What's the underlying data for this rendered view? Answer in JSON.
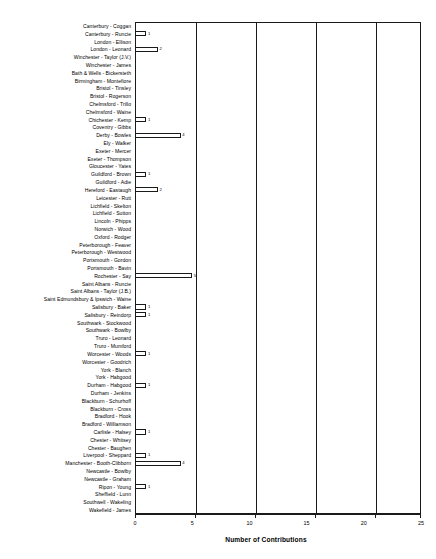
{
  "chart_data": {
    "type": "bar",
    "orientation": "horizontal",
    "title": "",
    "xlabel": "Number of Contributions",
    "ylabel": "",
    "xlim": [
      0,
      25
    ],
    "xticks": [
      0,
      5,
      10,
      15,
      20,
      25
    ],
    "gridlines": [
      5,
      10,
      15,
      20
    ],
    "grid": true,
    "legend": "none",
    "categories": [
      "Canterbury - Coggan",
      "Canterbury - Runcie",
      "London - Ellison",
      "London - Leonard",
      "Winchester - Taylor (J.V.)",
      "Winchester - James",
      "Bath & Wells - Bickersteth",
      "Birmingham - Montefiore",
      "Bristol - Tinsley",
      "Bristol - Rogerson",
      "Chelmsford - Trillo",
      "Chelmsford - Waine",
      "Chichester - Kemp",
      "Coventry - Gibbs",
      "Derby - Bowles",
      "Ely - Walker",
      "Exeter - Mercer",
      "Exeter - Thompson",
      "Gloucester - Yates",
      "Guildford - Brown",
      "Guildford - Adie",
      "Hereford - Eastaugh",
      "Leicester - Rutt",
      "Lichfield - Skelton",
      "Lichfield - Sutton",
      "Lincoln - Phipps",
      "Norwich - Wood",
      "Oxford - Rodger",
      "Peterborough - Feaver",
      "Peterborough - Westwood",
      "Portsmouth - Gordon",
      "Portsmouth - Bavin",
      "Rochester - Say",
      "Saint Albans - Runcie",
      "Saint Albans - Taylor (J.B.)",
      "Saint Edmundsbury & Ipswich - Waine",
      "Salisbury - Baker",
      "Salisbury - Reindorp",
      "Southwark - Stockwood",
      "Southwark - Bowlby",
      "Truro - Leonard",
      "Truro - Mumford",
      "Worcester - Woods",
      "Worcester - Goodrich",
      "York - Blanch",
      "York - Habgood",
      "Durham - Habgood",
      "Durham - Jenkins",
      "Blackburn - Schurhoff",
      "Blackburn - Cross",
      "Bradford - Hook",
      "Bradford - Williamson",
      "Carlisle - Halsey",
      "Chester - Whitsey",
      "Chester - Baughen",
      "Liverpool - Sheppard",
      "Manchester - Booth-Clibborn",
      "Newcastle - Bowlby",
      "Newcastle - Graham",
      "Ripon - Young",
      "Sheffield - Lunn",
      "Southwell - Wakeling",
      "Wakefield - James"
    ],
    "values": [
      0,
      1,
      0,
      2,
      0,
      0,
      0,
      0,
      0,
      0,
      0,
      0,
      1,
      0,
      4,
      0,
      0,
      0,
      0,
      1,
      0,
      2,
      0,
      0,
      0,
      0,
      0,
      0,
      0,
      0,
      0,
      0,
      5,
      0,
      0,
      0,
      1,
      1,
      0,
      0,
      0,
      0,
      1,
      0,
      0,
      0,
      1,
      0,
      0,
      0,
      0,
      0,
      1,
      0,
      0,
      1,
      4,
      0,
      0,
      1,
      0,
      0,
      0
    ],
    "value_labels": [
      "",
      "1",
      "",
      "2",
      "",
      "",
      "",
      "",
      "",
      "",
      "",
      "",
      "1",
      "",
      "4",
      "",
      "",
      "",
      "",
      "1",
      "",
      "2",
      "",
      "",
      "",
      "",
      "",
      "",
      "",
      "",
      "",
      "",
      "5",
      "",
      "",
      "",
      "1",
      "1",
      "",
      "",
      "",
      "",
      "1",
      "",
      "",
      "",
      "1",
      "",
      "",
      "",
      "",
      "",
      "1",
      "",
      "",
      "1",
      "4",
      "",
      "",
      "1",
      "",
      "",
      ""
    ],
    "colors": {
      "bar_fill": "#ffffff",
      "bar_edge": "#1a1a1a",
      "axis": "#1a1a1a",
      "background": "#ffffff",
      "text": "#000000"
    }
  }
}
